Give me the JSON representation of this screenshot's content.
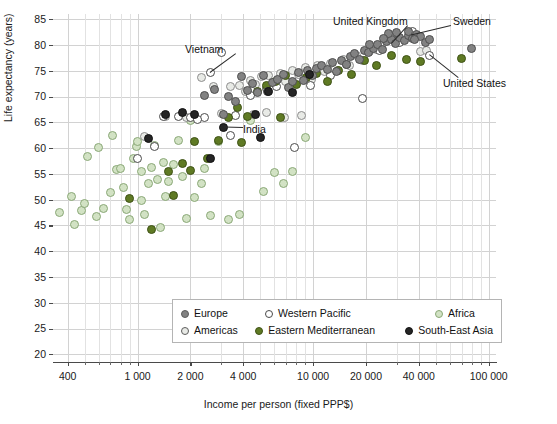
{
  "chart_data": {
    "type": "scatter",
    "title": "",
    "xlabel": "Income per person (fixed PPP$)",
    "ylabel": "Life expectancy (years)",
    "xscale": "log",
    "xlim": [
      330,
      110000
    ],
    "ylim": [
      18.5,
      86
    ],
    "grid": true,
    "x_ticks": [
      400,
      1000,
      2000,
      4000,
      10000,
      20000,
      40000,
      100000
    ],
    "x_tick_labels": [
      "400",
      "1 000",
      "2 000",
      "4 000",
      "10 000",
      "20 000",
      "40 000",
      "100 000"
    ],
    "y_ticks": [
      20,
      25,
      30,
      35,
      40,
      45,
      50,
      55,
      60,
      65,
      70,
      75,
      80,
      85
    ],
    "y_tick_labels": [
      "20",
      "25",
      "30",
      "35",
      "40",
      "45",
      "50",
      "55",
      "60",
      "65",
      "70",
      "75",
      "80",
      "85"
    ],
    "legend_position": "bottom-center",
    "series": [
      {
        "name": "Europe",
        "color": "#828282",
        "marker": "filled-circle",
        "points": [
          [
            2400,
            70.2
          ],
          [
            2750,
            71.3
          ],
          [
            3100,
            66.6
          ],
          [
            3300,
            70.1
          ],
          [
            3600,
            69.0
          ],
          [
            3900,
            73.9
          ],
          [
            4200,
            71.2
          ],
          [
            4500,
            72.6
          ],
          [
            4800,
            70.8
          ],
          [
            5200,
            74.0
          ],
          [
            5500,
            71.0
          ],
          [
            5900,
            72.8
          ],
          [
            6300,
            73.4
          ],
          [
            6800,
            74.2
          ],
          [
            7200,
            71.8
          ],
          [
            7600,
            73.0
          ],
          [
            8200,
            74.6
          ],
          [
            8800,
            73.2
          ],
          [
            9300,
            75.0
          ],
          [
            9900,
            74.1
          ],
          [
            10500,
            75.4
          ],
          [
            11200,
            76.0
          ],
          [
            12000,
            75.2
          ],
          [
            12800,
            76.6
          ],
          [
            13600,
            74.8
          ],
          [
            14500,
            77.0
          ],
          [
            15400,
            76.2
          ],
          [
            16300,
            77.8
          ],
          [
            17300,
            78.4
          ],
          [
            18400,
            77.2
          ],
          [
            19500,
            79.0
          ],
          [
            20700,
            78.6
          ],
          [
            22000,
            79.4
          ],
          [
            23300,
            80.0
          ],
          [
            24700,
            79.2
          ],
          [
            26200,
            80.6
          ],
          [
            27800,
            81.0
          ],
          [
            29500,
            80.2
          ],
          [
            31200,
            81.4
          ],
          [
            33000,
            80.8
          ],
          [
            34800,
            81.8
          ],
          [
            36800,
            81.2
          ],
          [
            38900,
            82.0
          ],
          [
            41000,
            81.6
          ],
          [
            43500,
            80.4
          ],
          [
            46000,
            81.0
          ],
          [
            27000,
            82.2
          ],
          [
            30000,
            82.4
          ],
          [
            35000,
            82.6
          ],
          [
            38000,
            81.0
          ],
          [
            25000,
            81.2
          ],
          [
            21000,
            80.0
          ],
          [
            80000,
            79.4
          ]
        ]
      },
      {
        "name": "Americas",
        "color": "#e8eae6",
        "marker": "filled-circle-light",
        "points": [
          [
            1100,
            62.3
          ],
          [
            1450,
            66.2
          ],
          [
            1900,
            65.9
          ],
          [
            2300,
            73.6
          ],
          [
            2700,
            72.0
          ],
          [
            3000,
            66.8
          ],
          [
            3400,
            71.9
          ],
          [
            3800,
            72.2
          ],
          [
            4100,
            70.9
          ],
          [
            4400,
            73.1
          ],
          [
            4700,
            72.4
          ],
          [
            5100,
            73.8
          ],
          [
            5600,
            74.0
          ],
          [
            6000,
            72.6
          ],
          [
            6500,
            74.4
          ],
          [
            7000,
            73.0
          ],
          [
            7600,
            75.1
          ],
          [
            8300,
            74.2
          ],
          [
            9000,
            75.6
          ],
          [
            9800,
            73.4
          ],
          [
            10600,
            76.0
          ],
          [
            11600,
            74.8
          ],
          [
            12600,
            76.4
          ],
          [
            13700,
            75.0
          ],
          [
            14900,
            77.2
          ],
          [
            16200,
            76.0
          ],
          [
            17700,
            78.0
          ],
          [
            19200,
            77.0
          ],
          [
            20900,
            78.8
          ],
          [
            22800,
            79.2
          ],
          [
            41000,
            78.8
          ],
          [
            44000,
            79.0
          ],
          [
            6900,
            66.0
          ],
          [
            8600,
            66.3
          ],
          [
            5400,
            67.0
          ],
          [
            4600,
            66.5
          ]
        ]
      },
      {
        "name": "Western Pacific",
        "color": "#ffffff",
        "marker": "open-circle",
        "points": [
          [
            3000,
            78.6
          ],
          [
            2600,
            74.6
          ],
          [
            1400,
            66.2
          ],
          [
            1700,
            66.1
          ],
          [
            2000,
            66.0
          ],
          [
            2400,
            66.0
          ],
          [
            3600,
            66.3
          ],
          [
            1250,
            60.3
          ],
          [
            19000,
            69.6
          ],
          [
            7800,
            60.2
          ],
          [
            3400,
            62.4
          ],
          [
            6200,
            72.0
          ],
          [
            9600,
            72.2
          ],
          [
            12500,
            74.0
          ],
          [
            15500,
            76.2
          ],
          [
            24000,
            79.0
          ],
          [
            31000,
            80.4
          ],
          [
            37000,
            82.6
          ],
          [
            46000,
            78.0
          ],
          [
            5400,
            71.6
          ],
          [
            4400,
            70.2
          ],
          [
            2200,
            65.6
          ],
          [
            1000,
            58.0
          ]
        ]
      },
      {
        "name": "Eastern Mediterranean",
        "color": "#5f7a24",
        "marker": "filled-circle",
        "points": [
          [
            900,
            50.2
          ],
          [
            1200,
            44.2
          ],
          [
            1500,
            55.4
          ],
          [
            1800,
            57.0
          ],
          [
            2100,
            61.2
          ],
          [
            2500,
            58.0
          ],
          [
            2900,
            61.4
          ],
          [
            3300,
            66.0
          ],
          [
            3700,
            67.8
          ],
          [
            4200,
            66.2
          ],
          [
            4800,
            71.0
          ],
          [
            5400,
            72.2
          ],
          [
            6100,
            73.0
          ],
          [
            7000,
            74.0
          ],
          [
            8000,
            72.4
          ],
          [
            9200,
            73.6
          ],
          [
            10500,
            74.4
          ],
          [
            12000,
            73.0
          ],
          [
            14000,
            75.0
          ],
          [
            16500,
            74.2
          ],
          [
            19500,
            77.0
          ],
          [
            23000,
            76.0
          ],
          [
            28000,
            78.0
          ],
          [
            34000,
            77.2
          ],
          [
            41000,
            76.8
          ],
          [
            70000,
            77.4
          ],
          [
            2000,
            55.6
          ],
          [
            1600,
            50.8
          ],
          [
            3900,
            61.0
          ],
          [
            6500,
            66.0
          ]
        ]
      },
      {
        "name": "Africa",
        "color": "#d2e2c4",
        "marker": "filled-circle",
        "points": [
          [
            360,
            47.6
          ],
          [
            420,
            50.6
          ],
          [
            440,
            45.2
          ],
          [
            480,
            47.8
          ],
          [
            520,
            58.4
          ],
          [
            600,
            60.2
          ],
          [
            640,
            48.2
          ],
          [
            700,
            51.4
          ],
          [
            760,
            55.8
          ],
          [
            800,
            56.0
          ],
          [
            830,
            52.4
          ],
          [
            870,
            48.0
          ],
          [
            900,
            46.2
          ],
          [
            950,
            58.0
          ],
          [
            980,
            60.4
          ],
          [
            1000,
            61.2
          ],
          [
            1050,
            49.8
          ],
          [
            1100,
            47.2
          ],
          [
            1150,
            53.2
          ],
          [
            1200,
            56.2
          ],
          [
            1250,
            60.6
          ],
          [
            1300,
            54.0
          ],
          [
            1400,
            57.2
          ],
          [
            1450,
            50.6
          ],
          [
            1500,
            53.6
          ],
          [
            1600,
            56.8
          ],
          [
            1700,
            61.4
          ],
          [
            1800,
            54.4
          ],
          [
            1900,
            46.4
          ],
          [
            2000,
            65.4
          ],
          [
            2100,
            50.4
          ],
          [
            2300,
            53.2
          ],
          [
            2600,
            47.0
          ],
          [
            2900,
            61.2
          ],
          [
            3300,
            46.2
          ],
          [
            3800,
            47.2
          ],
          [
            4400,
            65.4
          ],
          [
            5200,
            51.6
          ],
          [
            6000,
            55.2
          ],
          [
            6800,
            53.2
          ],
          [
            7600,
            55.4
          ],
          [
            9000,
            62.0
          ],
          [
            1050,
            55.4
          ],
          [
            720,
            62.4
          ],
          [
            1350,
            44.6
          ],
          [
            2400,
            56.0
          ],
          [
            500,
            49.2
          ],
          [
            580,
            46.8
          ]
        ]
      },
      {
        "name": "South-East Asia",
        "color": "#252525",
        "marker": "filled-circle",
        "points": [
          [
            1450,
            66.6
          ],
          [
            1150,
            61.8
          ],
          [
            2100,
            66.5
          ],
          [
            3100,
            64.0
          ],
          [
            4700,
            66.6
          ],
          [
            5600,
            71.0
          ],
          [
            7600,
            70.8
          ],
          [
            9500,
            74.2
          ],
          [
            1800,
            67.0
          ],
          [
            5000,
            62.0
          ],
          [
            2600,
            58.0
          ]
        ]
      }
    ],
    "annotations": [
      {
        "label": "United Kingdom",
        "x": 28000,
        "y": 80.2
      },
      {
        "label": "Sweden",
        "x": 36000,
        "y": 81.8
      },
      {
        "label": "United States",
        "x": 46000,
        "y": 78.0
      },
      {
        "label": "Vietnam",
        "x": 2600,
        "y": 74.6
      },
      {
        "label": "India",
        "x": 3100,
        "y": 64.0
      }
    ]
  },
  "legend": {
    "items": [
      {
        "label": "Europe",
        "color": "#828282",
        "style": "filled"
      },
      {
        "label": "Western Pacific",
        "color": "#ffffff",
        "style": "open"
      },
      {
        "label": "Africa",
        "color": "#d2e2c4",
        "style": "filled"
      },
      {
        "label": "Americas",
        "color": "#e8eae6",
        "style": "filled"
      },
      {
        "label": "Eastern Mediterranean",
        "color": "#5f7a24",
        "style": "filled"
      },
      {
        "label": "South-East Asia",
        "color": "#252525",
        "style": "filled"
      }
    ]
  },
  "annotation_labels": {
    "united_kingdom": "United Kingdom",
    "sweden": "Sweden",
    "united_states": "United States",
    "vietnam": "Vietnam",
    "india": "India"
  }
}
